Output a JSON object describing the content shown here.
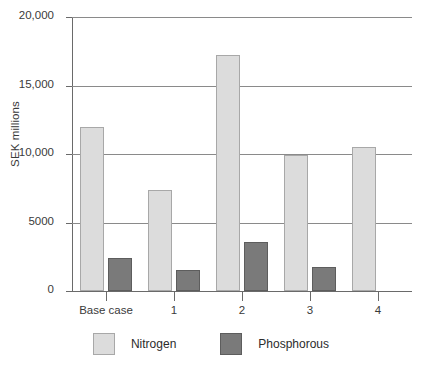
{
  "chart_data": {
    "type": "bar",
    "title": "",
    "subtitle": "",
    "xlabel": "",
    "ylabel": "SEK millions",
    "categories": [
      "Base case",
      "1",
      "2",
      "3",
      "4"
    ],
    "series": [
      {
        "name": "Nitrogen",
        "color": "#dcdcdc",
        "values": [
          12000,
          7400,
          17200,
          9900,
          10500
        ]
      },
      {
        "name": "Phosphorous",
        "color": "#7a7a7a",
        "values": [
          2400,
          1550,
          3550,
          1750,
          null
        ]
      }
    ],
    "ylim": [
      0,
      20000
    ],
    "yticks": [
      0,
      5000,
      10000,
      15000,
      20000
    ],
    "ytick_labels": [
      "0",
      "5000",
      "10,000",
      "15,000",
      "20,000"
    ],
    "grid": true,
    "grid_axis": "y",
    "legend_position": "bottom"
  },
  "legend": {
    "items": [
      {
        "label": "Nitrogen",
        "swatch": "nitrogen-swatch"
      },
      {
        "label": "Phosphorous",
        "swatch": "phosphorous-swatch"
      }
    ]
  },
  "axis": {
    "y_title": "SEK millions"
  }
}
